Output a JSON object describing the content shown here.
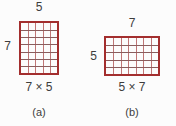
{
  "background": "#fcfcfc",
  "colors": {
    "grid_border": "#a32e2e",
    "grid_line_vertical": "#c07676",
    "grid_line_horizontal": "#8a5d5d",
    "label_text": "#3d3d3d"
  },
  "figures": [
    {
      "id": "a",
      "top_label": "5",
      "side_label": "7",
      "product_label": "7 × 5",
      "caption": "(a)",
      "grid": {
        "rows": 7,
        "cols": 5
      }
    },
    {
      "id": "b",
      "top_label": "7",
      "side_label": "5",
      "product_label": "5 × 7",
      "caption": "(b)",
      "grid": {
        "rows": 5,
        "cols": 7
      }
    }
  ]
}
